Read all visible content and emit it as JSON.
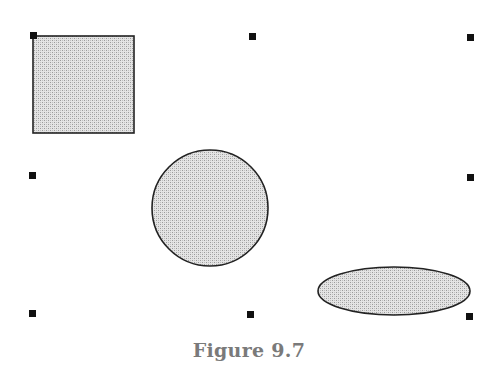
{
  "figure": {
    "caption": "Figure 9.7",
    "fill_color": "#d4d4d4",
    "stroke_color": "#222222",
    "shapes": [
      {
        "type": "rectangle",
        "x": 33,
        "y": 36,
        "width": 101,
        "height": 97
      },
      {
        "type": "circle",
        "cx": 210,
        "cy": 208,
        "r": 58
      },
      {
        "type": "ellipse",
        "cx": 394,
        "cy": 291,
        "rx": 76,
        "ry": 24
      }
    ],
    "selection_handles": [
      {
        "x": 33,
        "y": 35
      },
      {
        "x": 252,
        "y": 36
      },
      {
        "x": 470,
        "y": 37
      },
      {
        "x": 32,
        "y": 175
      },
      {
        "x": 470,
        "y": 177
      },
      {
        "x": 32,
        "y": 313
      },
      {
        "x": 250,
        "y": 314
      },
      {
        "x": 469,
        "y": 316
      }
    ]
  }
}
